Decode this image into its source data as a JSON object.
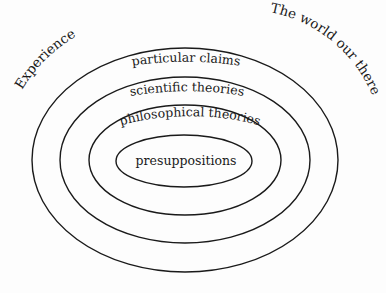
{
  "diagram": {
    "outer_labels": {
      "left": "Experience",
      "right": "The world our there"
    },
    "rings": [
      {
        "label": "particular claims"
      },
      {
        "label": "scientific theories"
      },
      {
        "label": "philosophical theories"
      },
      {
        "label": "presuppositions"
      }
    ],
    "colors": {
      "background": "#fdfdfd",
      "stroke": "#1a1a1a",
      "text": "#1a1a1a"
    }
  }
}
